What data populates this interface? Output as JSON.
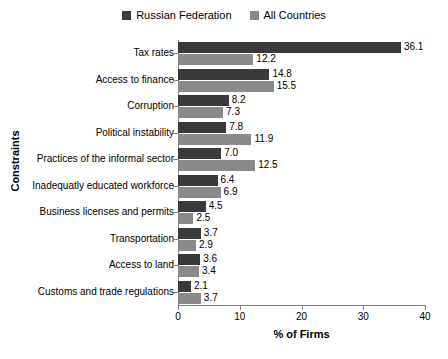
{
  "chart_data": {
    "type": "bar",
    "orientation": "horizontal",
    "title": "",
    "xlabel": "% of Firms",
    "ylabel": "Constraints",
    "xlim": [
      0,
      40
    ],
    "xticks": [
      0,
      10,
      20,
      30,
      40
    ],
    "grid": false,
    "legend_position": "top-center",
    "categories": [
      "Tax rates",
      "Access to finance",
      "Corruption",
      "Political instability",
      "Practices of the informal sector",
      "Inadequatly educated workforce",
      "Business licenses and permits",
      "Transportation",
      "Access to land",
      "Customs and trade regulations"
    ],
    "series": [
      {
        "name": "Russian Federation",
        "color": "#3a3a3a",
        "values": [
          36.1,
          14.8,
          8.2,
          7.8,
          7.0,
          6.4,
          4.5,
          3.7,
          3.6,
          2.1
        ]
      },
      {
        "name": "All Countries",
        "color": "#8a8a8a",
        "values": [
          12.2,
          15.5,
          7.3,
          11.9,
          12.5,
          6.9,
          2.5,
          2.9,
          3.4,
          3.7
        ]
      }
    ]
  }
}
